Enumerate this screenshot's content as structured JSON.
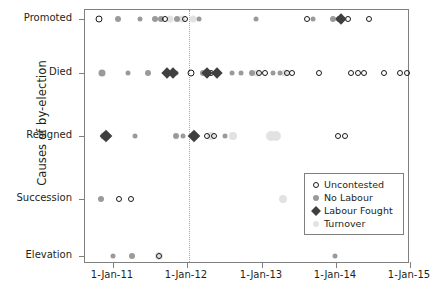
{
  "chart_data": {
    "type": "scatter",
    "title": "",
    "xlabel": "",
    "ylabel": "Causes of by-election",
    "grid": false,
    "legend_position": "inside-bottom-right",
    "x_axis": {
      "tick_labels": [
        "1-Jan-11",
        "1-Jan-12",
        "1-Jan-13",
        "1-Jan-14",
        "1-Jan-15"
      ],
      "tick_x_px": [
        112,
        186,
        261,
        335,
        409
      ],
      "min_label": "1-Jan-11",
      "max_label": "1-Jan-15"
    },
    "y_axis": {
      "categories": [
        "Promoted",
        "Died",
        "Resigned",
        "Succession",
        "Elevation"
      ],
      "tick_y_px": [
        18,
        72,
        135,
        198,
        255
      ]
    },
    "annotations": [
      {
        "name": "reference-line",
        "x_px": 188,
        "style": "dotted-vertical"
      }
    ],
    "legend": [
      {
        "label": "Uncontested",
        "marker": "open-circle",
        "color": "#1a1a1a"
      },
      {
        "label": "No Labour",
        "marker": "filled-circle",
        "color": "#9a9a9a"
      },
      {
        "label": "Labour Fought",
        "marker": "filled-diamond",
        "color": "#3f3f3f"
      },
      {
        "label": "Turnover",
        "marker": "filled-circle-light",
        "color": "#e2e2e2"
      }
    ],
    "series": [
      {
        "name": "Uncontested",
        "marker": "open-circle",
        "points": [
          {
            "x_px": 98,
            "category": "Promoted",
            "size": 7
          },
          {
            "x_px": 164,
            "category": "Promoted",
            "size": 6
          },
          {
            "x_px": 184,
            "category": "Promoted",
            "size": 6
          },
          {
            "x_px": 306,
            "category": "Promoted",
            "size": 6
          },
          {
            "x_px": 338,
            "category": "Promoted",
            "size": 6
          },
          {
            "x_px": 347,
            "category": "Promoted",
            "size": 6
          },
          {
            "x_px": 368,
            "category": "Promoted",
            "size": 6
          },
          {
            "x_px": 190,
            "category": "Died",
            "size": 7
          },
          {
            "x_px": 210,
            "category": "Died",
            "size": 6
          },
          {
            "x_px": 258,
            "category": "Died",
            "size": 6
          },
          {
            "x_px": 264,
            "category": "Died",
            "size": 6
          },
          {
            "x_px": 286,
            "category": "Died",
            "size": 6
          },
          {
            "x_px": 291,
            "category": "Died",
            "size": 6
          },
          {
            "x_px": 318,
            "category": "Died",
            "size": 6
          },
          {
            "x_px": 350,
            "category": "Died",
            "size": 6
          },
          {
            "x_px": 357,
            "category": "Died",
            "size": 6
          },
          {
            "x_px": 363,
            "category": "Died",
            "size": 6
          },
          {
            "x_px": 383,
            "category": "Died",
            "size": 6
          },
          {
            "x_px": 399,
            "category": "Died",
            "size": 6
          },
          {
            "x_px": 406,
            "category": "Died",
            "size": 6
          },
          {
            "x_px": 206,
            "category": "Resigned",
            "size": 6
          },
          {
            "x_px": 213,
            "category": "Resigned",
            "size": 6
          },
          {
            "x_px": 337,
            "category": "Resigned",
            "size": 6
          },
          {
            "x_px": 344,
            "category": "Resigned",
            "size": 6
          },
          {
            "x_px": 118,
            "category": "Succession",
            "size": 6
          },
          {
            "x_px": 130,
            "category": "Succession",
            "size": 6
          },
          {
            "x_px": 158,
            "category": "Elevation",
            "size": 6
          }
        ]
      },
      {
        "name": "No Labour",
        "marker": "filled-circle",
        "points": [
          {
            "x_px": 117,
            "category": "Promoted",
            "size": 6
          },
          {
            "x_px": 139,
            "category": "Promoted",
            "size": 5
          },
          {
            "x_px": 154,
            "category": "Promoted",
            "size": 6
          },
          {
            "x_px": 160,
            "category": "Promoted",
            "size": 6
          },
          {
            "x_px": 176,
            "category": "Promoted",
            "size": 6
          },
          {
            "x_px": 198,
            "category": "Promoted",
            "size": 5
          },
          {
            "x_px": 255,
            "category": "Promoted",
            "size": 5
          },
          {
            "x_px": 312,
            "category": "Promoted",
            "size": 5
          },
          {
            "x_px": 332,
            "category": "Promoted",
            "size": 6
          },
          {
            "x_px": 101,
            "category": "Died",
            "size": 7
          },
          {
            "x_px": 127,
            "category": "Died",
            "size": 5
          },
          {
            "x_px": 147,
            "category": "Died",
            "size": 6
          },
          {
            "x_px": 175,
            "category": "Died",
            "size": 5
          },
          {
            "x_px": 202,
            "category": "Died",
            "size": 6
          },
          {
            "x_px": 231,
            "category": "Died",
            "size": 5
          },
          {
            "x_px": 240,
            "category": "Died",
            "size": 5
          },
          {
            "x_px": 251,
            "category": "Died",
            "size": 6
          },
          {
            "x_px": 272,
            "category": "Died",
            "size": 5
          },
          {
            "x_px": 279,
            "category": "Died",
            "size": 5
          },
          {
            "x_px": 103,
            "category": "Resigned",
            "size": 7
          },
          {
            "x_px": 134,
            "category": "Resigned",
            "size": 5
          },
          {
            "x_px": 175,
            "category": "Resigned",
            "size": 6
          },
          {
            "x_px": 182,
            "category": "Resigned",
            "size": 5
          },
          {
            "x_px": 224,
            "category": "Resigned",
            "size": 5
          },
          {
            "x_px": 100,
            "category": "Succession",
            "size": 6
          },
          {
            "x_px": 112,
            "category": "Elevation",
            "size": 5
          },
          {
            "x_px": 131,
            "category": "Elevation",
            "size": 6
          },
          {
            "x_px": 334,
            "category": "Elevation",
            "size": 5
          }
        ]
      },
      {
        "name": "Labour Fought",
        "marker": "filled-diamond",
        "points": [
          {
            "x_px": 340,
            "category": "Promoted",
            "size": 8
          },
          {
            "x_px": 166,
            "category": "Died",
            "size": 8
          },
          {
            "x_px": 172,
            "category": "Died",
            "size": 8
          },
          {
            "x_px": 206,
            "category": "Died",
            "size": 8
          },
          {
            "x_px": 216,
            "category": "Died",
            "size": 8
          },
          {
            "x_px": 105,
            "category": "Resigned",
            "size": 9
          },
          {
            "x_px": 193,
            "category": "Resigned",
            "size": 9
          }
        ]
      },
      {
        "name": "Turnover",
        "marker": "filled-circle-light",
        "points": [
          {
            "x_px": 169,
            "category": "Promoted",
            "size": 7
          },
          {
            "x_px": 181,
            "category": "Promoted",
            "size": 7
          },
          {
            "x_px": 192,
            "category": "Promoted",
            "size": 7
          },
          {
            "x_px": 205,
            "category": "Died",
            "size": 8
          },
          {
            "x_px": 256,
            "category": "Died",
            "size": 7
          },
          {
            "x_px": 284,
            "category": "Died",
            "size": 7
          },
          {
            "x_px": 210,
            "category": "Resigned",
            "size": 8
          },
          {
            "x_px": 232,
            "category": "Resigned",
            "size": 8
          },
          {
            "x_px": 270,
            "category": "Resigned",
            "size": 10
          },
          {
            "x_px": 275,
            "category": "Resigned",
            "size": 10
          },
          {
            "x_px": 282,
            "category": "Succession",
            "size": 8
          },
          {
            "x_px": 158,
            "category": "Elevation",
            "size": 8
          }
        ]
      }
    ]
  }
}
